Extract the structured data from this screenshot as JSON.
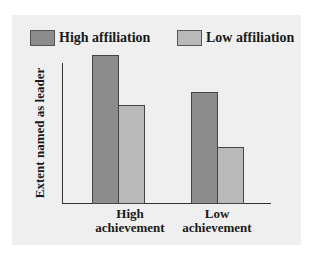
{
  "chart_data": {
    "type": "bar",
    "title": "",
    "xlabel": "",
    "ylabel": "Extent named as leader",
    "categories": [
      "High achievement",
      "Low achievement"
    ],
    "category_lines": [
      [
        "High",
        "achievement"
      ],
      [
        "Low",
        "achievement"
      ]
    ],
    "series": [
      {
        "name": "High affiliation",
        "color": "#8c8c8c",
        "values": [
          100,
          75
        ]
      },
      {
        "name": "Low affiliation",
        "color": "#b9b9b9",
        "values": [
          66,
          38
        ]
      }
    ],
    "ylim": [
      0,
      100
    ],
    "grid": false,
    "y_ticks": false,
    "legend_position": "top",
    "note": "Values are relative bar heights (no axis scale shown)"
  },
  "legend": {
    "items": [
      {
        "label": "High affiliation",
        "color": "#8c8c8c"
      },
      {
        "label": "Low affiliation",
        "color": "#b9b9b9"
      }
    ]
  },
  "colors": {
    "background": "#efefef",
    "axis": "#333333",
    "high_affiliation": "#8c8c8c",
    "low_affiliation": "#b9b9b9"
  }
}
